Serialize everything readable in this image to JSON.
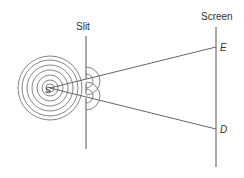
{
  "diagram": {
    "labels": {
      "slit": "Slit",
      "screen": "Screen",
      "point_e": "E",
      "point_d": "D",
      "source": "S"
    },
    "source": {
      "x": 50,
      "y": 88,
      "ring_radii": [
        4,
        8,
        13,
        18,
        23,
        28,
        32
      ]
    },
    "slit": {
      "x": 86,
      "y1": 36,
      "y2": 149,
      "openings_y": [
        81,
        96
      ],
      "wavelet_radii": [
        7,
        14
      ]
    },
    "screen": {
      "x": 216,
      "y1": 27,
      "y2": 167
    },
    "rays": [
      {
        "from": "S",
        "to": "E",
        "x2": 216,
        "y2": 47
      },
      {
        "from": "S",
        "to": "D",
        "x2": 216,
        "y2": 129
      }
    ],
    "colors": {
      "line": "#555555",
      "text": "#333333"
    }
  }
}
